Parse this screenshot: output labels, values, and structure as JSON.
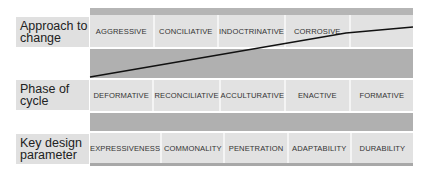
{
  "rows": [
    {
      "label": "Approach to change",
      "label_lines": [
        "Approach to",
        "change"
      ],
      "cells": [
        "AGGRESSIVE",
        "CONCILIATIVE",
        "INDOCTRINATIVE",
        "CORROSIVE",
        ""
      ]
    },
    {
      "label": "Phase of cycle",
      "label_lines": [
        "Phase of",
        "cycle"
      ],
      "cells": [
        "DEFORMATIVE",
        "RECONCILIATIVE",
        "ACCULTURATIVE",
        "ENACTIVE",
        "FORMATIVE"
      ]
    },
    {
      "label": "Key design parameter",
      "label_lines": [
        "Key design",
        "parameter"
      ],
      "cells": [
        "EXPRESSIVENESS",
        "COMMONALITY",
        "PENETRATION",
        "ADAPTABILITY",
        "DURABILITY"
      ]
    }
  ],
  "colors": {
    "cell_bg": "#e2e2e2",
    "band_bg": "#b0b0b0",
    "trend_line": "#111111"
  }
}
